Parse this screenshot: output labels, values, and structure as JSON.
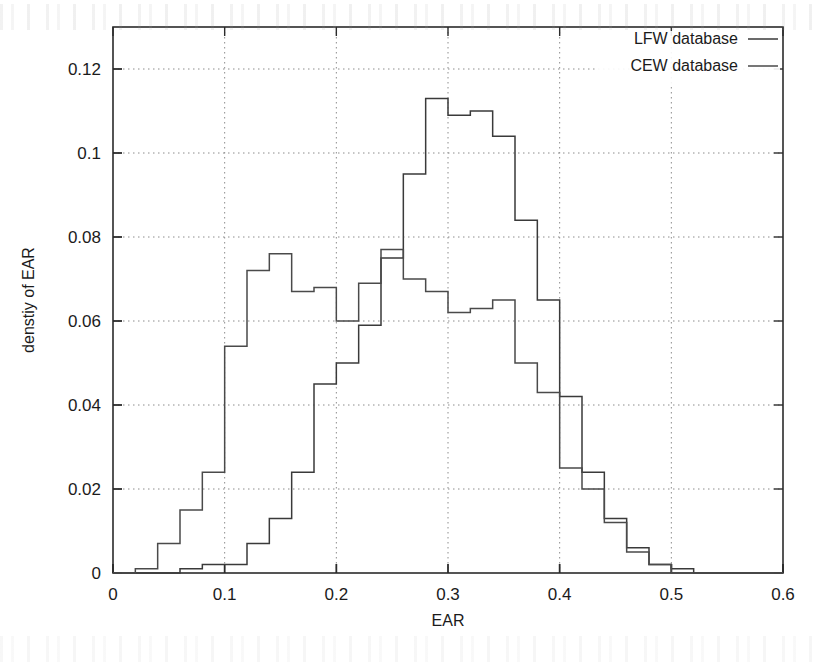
{
  "chart_data": {
    "type": "bar",
    "title": "",
    "subtitle": "",
    "xlabel": "EAR",
    "ylabel": "denstiy of EAR",
    "xlim": [
      0,
      0.6
    ],
    "ylim": [
      0,
      0.13
    ],
    "xticks": [
      "0",
      "0.1",
      "0.2",
      "0.3",
      "0.4",
      "0.5",
      "0.6"
    ],
    "xtick_values": [
      0,
      0.1,
      0.2,
      0.3,
      0.4,
      0.5,
      0.6
    ],
    "yticks": [
      "0",
      "0.02",
      "0.04",
      "0.06",
      "0.08",
      "0.1",
      "0.12"
    ],
    "ytick_values": [
      0,
      0.02,
      0.04,
      0.06,
      0.08,
      0.1,
      0.12
    ],
    "grid": true,
    "legend_position": "top-right",
    "bin_width": 0.02,
    "bin_edges": [
      0.0,
      0.02,
      0.04,
      0.06,
      0.08,
      0.1,
      0.12,
      0.14,
      0.16,
      0.18,
      0.2,
      0.22,
      0.24,
      0.26,
      0.28,
      0.3,
      0.32,
      0.34,
      0.36,
      0.38,
      0.4,
      0.42,
      0.44,
      0.46,
      0.48,
      0.5,
      0.52,
      0.54,
      0.56,
      0.58,
      0.6
    ],
    "series": [
      {
        "name": "LFW database",
        "color": "#3a3a3a",
        "values": [
          0.0,
          0.0,
          0.0,
          0.001,
          0.002,
          0.002,
          0.007,
          0.013,
          0.024,
          0.045,
          0.05,
          0.059,
          0.075,
          0.095,
          0.113,
          0.109,
          0.11,
          0.104,
          0.084,
          0.065,
          0.042,
          0.024,
          0.013,
          0.006,
          0.002,
          0.001,
          0.0,
          0.0,
          0.0,
          0.0
        ]
      },
      {
        "name": "CEW database",
        "color": "#4a4a4a",
        "values": [
          0.0,
          0.001,
          0.007,
          0.015,
          0.024,
          0.054,
          0.072,
          0.076,
          0.067,
          0.068,
          0.06,
          0.069,
          0.077,
          0.07,
          0.067,
          0.062,
          0.063,
          0.065,
          0.05,
          0.043,
          0.025,
          0.02,
          0.012,
          0.005,
          0.002,
          0.0,
          0.0,
          0.0,
          0.0,
          0.0
        ]
      }
    ]
  },
  "legend": {
    "entries": [
      {
        "label": "LFW database"
      },
      {
        "label": "CEW database"
      }
    ]
  },
  "axes": {
    "x_title": "EAR",
    "y_title": "denstiy of EAR"
  }
}
